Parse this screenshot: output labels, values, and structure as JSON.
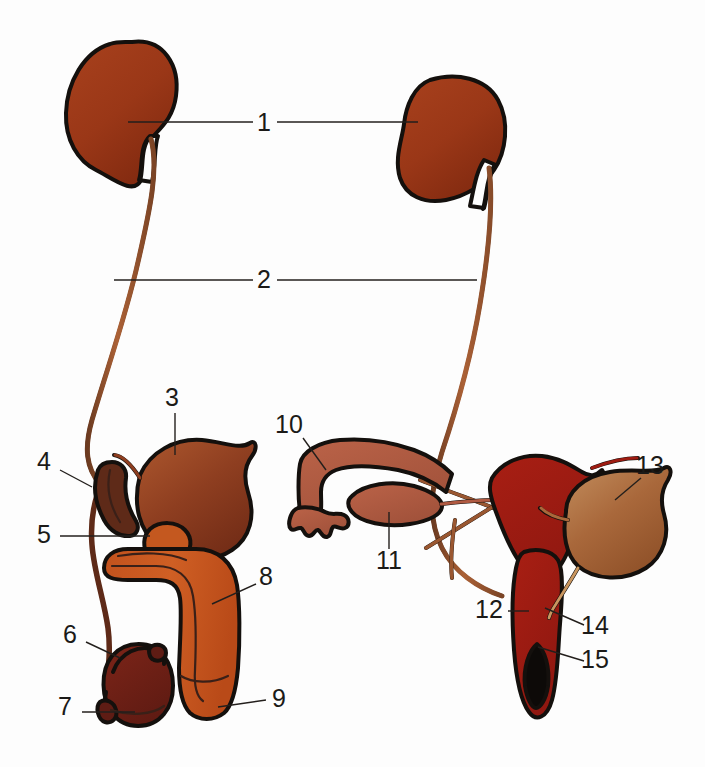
{
  "figure": {
    "background_color": "#fdfdfd",
    "outline_color": "#14100d"
  },
  "palette": {
    "kidney": "#9e3a18",
    "kidney_dark": "#7d2a12",
    "ureter": "#a45a32",
    "ureter_dark": "#6b3a20",
    "bladder_male": "#8a3a20",
    "bladder_male_light": "#a8502c",
    "bladder_female": "#a8673c",
    "bladder_female_light": "#c08a5a",
    "prostate": "#c4581f",
    "penis": "#cc5a22",
    "penis_light": "#d1682c",
    "testis": "#6e2018",
    "epididymis": "#5e1c14",
    "vas_deferens": "#5e2a18",
    "uterus": "#9e1c12",
    "ovary": "#b05a42",
    "fallopian": "#b05a42",
    "vaginal_opening": "#0d0a08",
    "label_text": "#1b1a18",
    "leader_line": "#231f1c"
  },
  "labels": [
    {
      "id": "1",
      "text": "1",
      "x": 264,
      "y": 124,
      "name": "label-1-kidney"
    },
    {
      "id": "2",
      "text": "2",
      "x": 264,
      "y": 281,
      "name": "label-2-ureter"
    },
    {
      "id": "3",
      "text": "3",
      "x": 172,
      "y": 399,
      "name": "label-3-urinary-bladder-male"
    },
    {
      "id": "4",
      "text": "4",
      "x": 44,
      "y": 463,
      "name": "label-4-vas-deferens"
    },
    {
      "id": "5",
      "text": "5",
      "x": 44,
      "y": 536,
      "name": "label-5-prostate-gland"
    },
    {
      "id": "6",
      "text": "6",
      "x": 70,
      "y": 636,
      "name": "label-6-epididymis"
    },
    {
      "id": "7",
      "text": "7",
      "x": 65,
      "y": 708,
      "name": "label-7-testis"
    },
    {
      "id": "8",
      "text": "8",
      "x": 266,
      "y": 578,
      "name": "label-8-penis"
    },
    {
      "id": "9",
      "text": "9",
      "x": 279,
      "y": 700,
      "name": "label-9-glans-penis"
    },
    {
      "id": "10",
      "text": "10",
      "x": 289,
      "y": 426,
      "name": "label-10-fallopian-tube"
    },
    {
      "id": "11",
      "text": "11",
      "x": 389,
      "y": 562,
      "name": "label-11-ovary"
    },
    {
      "id": "12",
      "text": "12",
      "x": 489,
      "y": 611,
      "name": "label-12-cervix-vagina"
    },
    {
      "id": "13",
      "text": "13",
      "x": 650,
      "y": 467,
      "name": "label-13-urinary-bladder-female"
    },
    {
      "id": "14",
      "text": "14",
      "x": 595,
      "y": 627,
      "name": "label-14-urethra"
    },
    {
      "id": "15",
      "text": "15",
      "x": 595,
      "y": 661,
      "name": "label-15-vaginal-opening"
    }
  ],
  "leaders": [
    {
      "name": "leader-1-left",
      "points": "128,122 253,122"
    },
    {
      "name": "leader-1-right",
      "points": "418,122 277,122"
    },
    {
      "name": "leader-2-left",
      "points": "114,280 253,280"
    },
    {
      "name": "leader-2-right",
      "points": "477,280 277,280"
    },
    {
      "name": "leader-3",
      "points": "175,413 175,455"
    },
    {
      "name": "leader-4",
      "points": "60,470 92,487"
    },
    {
      "name": "leader-5",
      "points": "60,536 150,536"
    },
    {
      "name": "leader-6",
      "points": "86,642 120,658"
    },
    {
      "name": "leader-7",
      "points": "82,712 135,712"
    },
    {
      "name": "leader-8",
      "points": "256,584 212,604"
    },
    {
      "name": "leader-9",
      "points": "266,700 218,707"
    },
    {
      "name": "leader-10",
      "points": "303,438 326,470"
    },
    {
      "name": "leader-11",
      "points": "389,549 389,512"
    },
    {
      "name": "leader-12",
      "points": "508,611 529,611"
    },
    {
      "name": "leader-13",
      "points": "641,478 615,500"
    },
    {
      "name": "leader-14",
      "points": "584,625 545,608"
    },
    {
      "name": "leader-15",
      "points": "584,661 538,647"
    }
  ],
  "organs": {
    "kidney_left": {
      "name": "kidney-left",
      "number": "1"
    },
    "kidney_right": {
      "name": "kidney-right",
      "number": "1"
    },
    "ureter_left": {
      "name": "ureter-left",
      "number": "2"
    },
    "ureter_right": {
      "name": "ureter-right",
      "number": "2"
    },
    "bladder_male": {
      "name": "urinary-bladder-male",
      "number": "3"
    },
    "vas_deferens": {
      "name": "vas-deferens",
      "number": "4"
    },
    "prostate": {
      "name": "prostate-gland",
      "number": "5"
    },
    "epididymis": {
      "name": "epididymis",
      "number": "6"
    },
    "testis": {
      "name": "testis",
      "number": "7"
    },
    "penis": {
      "name": "penis",
      "number": "8"
    },
    "glans": {
      "name": "glans-penis",
      "number": "9"
    },
    "fallopian_tube": {
      "name": "fallopian-tube",
      "number": "10"
    },
    "ovary": {
      "name": "ovary",
      "number": "11"
    },
    "vagina": {
      "name": "vagina-cervix",
      "number": "12"
    },
    "bladder_female": {
      "name": "urinary-bladder-female",
      "number": "13"
    },
    "urethra_female": {
      "name": "urethra-female",
      "number": "14"
    },
    "vaginal_opening": {
      "name": "vaginal-opening",
      "number": "15"
    }
  }
}
